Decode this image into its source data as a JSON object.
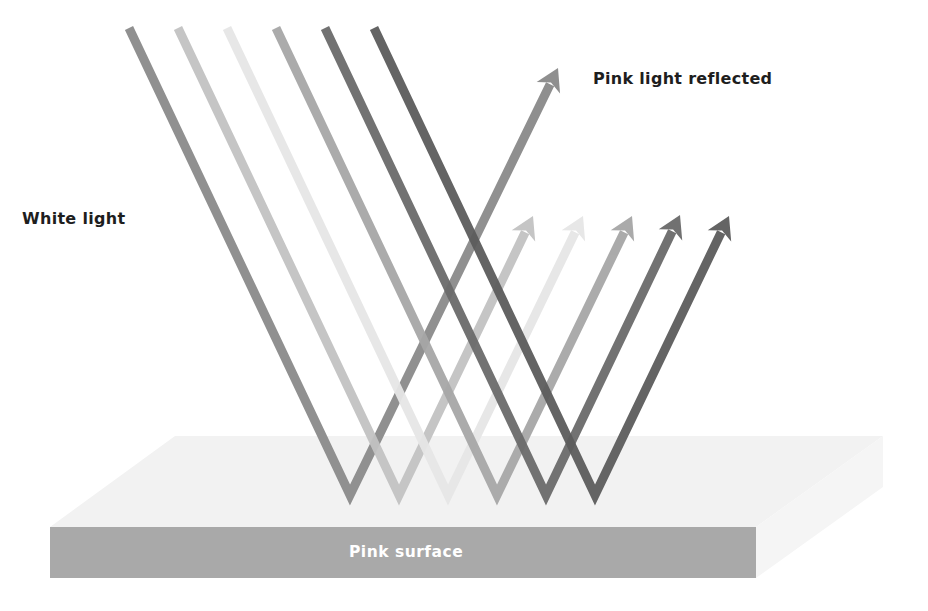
{
  "labels": {
    "incoming": "White light",
    "reflected": "Pink light reflected",
    "surface": "Pink surface"
  },
  "colors": {
    "background": "#ffffff",
    "surface_top": "#f2f2f2",
    "surface_right": "#f4f4f4",
    "surface_front": "#a9a9a9",
    "text": "#1e1e1e",
    "surface_text": "#ffffff"
  },
  "rays": [
    {
      "color": "#8a8a8a",
      "start": [
        129,
        28
      ],
      "bottom": [
        350,
        495
      ],
      "tip": [
        558,
        68
      ],
      "highlighted": true
    },
    {
      "color": "#c2c2c2",
      "start": [
        178,
        28
      ],
      "bottom": [
        399,
        495
      ],
      "tip": [
        533,
        216
      ]
    },
    {
      "color": "#e6e6e6",
      "start": [
        227,
        28
      ],
      "bottom": [
        448,
        495
      ],
      "tip": [
        583,
        216
      ]
    },
    {
      "color": "#a6a6a6",
      "start": [
        276,
        28
      ],
      "bottom": [
        497,
        495
      ],
      "tip": [
        632,
        216
      ]
    },
    {
      "color": "#6a6a6a",
      "start": [
        325,
        28
      ],
      "bottom": [
        546,
        495
      ],
      "tip": [
        680,
        215
      ]
    },
    {
      "color": "#5c5c5c",
      "start": [
        374,
        28
      ],
      "bottom": [
        595,
        495
      ],
      "tip": [
        729,
        216
      ]
    }
  ]
}
